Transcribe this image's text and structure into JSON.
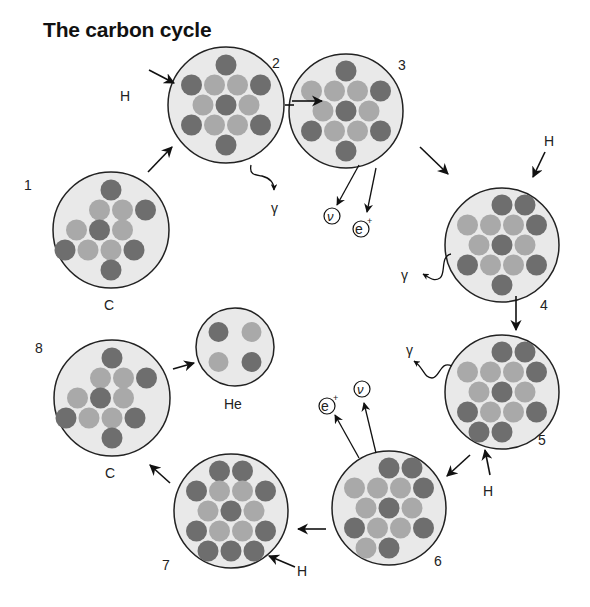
{
  "title": "The carbon cycle",
  "colors": {
    "nucleus_fill": "#e9e9e9",
    "outline": "#222222",
    "dark": "#6e6e6e",
    "light": "#a9a9a9"
  },
  "nuclei": [
    {
      "step": "1",
      "label": "C",
      "cx": 111,
      "cy": 230,
      "r": 58,
      "rows": [
        [
          "D"
        ],
        [
          "L",
          "L",
          "D"
        ],
        [
          "L",
          "D",
          "L"
        ],
        [
          "D",
          "L",
          "L",
          "D"
        ],
        [
          "D"
        ]
      ],
      "offsets": [
        0,
        0.5,
        -0.5,
        -0.5,
        0
      ]
    },
    {
      "step": "2",
      "label": "",
      "cx": 226,
      "cy": 105,
      "r": 58,
      "rows": [
        [
          "D"
        ],
        [
          "D",
          "L",
          "L",
          "D"
        ],
        [
          "L",
          "D",
          "L"
        ],
        [
          "D",
          "L",
          "L",
          "D"
        ],
        [
          "D"
        ]
      ],
      "offsets": [
        0,
        0,
        0,
        0,
        0
      ]
    },
    {
      "step": "3",
      "label": "",
      "cx": 346,
      "cy": 111,
      "r": 57,
      "rows": [
        [
          "D"
        ],
        [
          "L",
          "L",
          "L",
          "D"
        ],
        [
          "L",
          "D",
          "L"
        ],
        [
          "D",
          "L",
          "L",
          "D"
        ],
        [
          "D"
        ]
      ],
      "offsets": [
        0,
        0,
        0,
        0,
        0
      ]
    },
    {
      "step": "4",
      "label": "",
      "cx": 502,
      "cy": 245,
      "r": 57,
      "rows": [
        [
          "D",
          "D"
        ],
        [
          "L",
          "L",
          "L",
          "D"
        ],
        [
          "L",
          "D",
          "L"
        ],
        [
          "D",
          "L",
          "L",
          "D"
        ],
        [
          "D"
        ]
      ],
      "offsets": [
        0.5,
        0,
        0,
        0,
        0
      ]
    },
    {
      "step": "5",
      "label": "",
      "cx": 502,
      "cy": 392,
      "r": 57,
      "rows": [
        [
          "D",
          "D"
        ],
        [
          "L",
          "L",
          "L",
          "D"
        ],
        [
          "L",
          "D",
          "L"
        ],
        [
          "D",
          "L",
          "L",
          "D"
        ],
        [
          "D",
          "D"
        ]
      ],
      "offsets": [
        0.5,
        0,
        0,
        0,
        -0.5
      ]
    },
    {
      "step": "6",
      "label": "",
      "cx": 389,
      "cy": 508,
      "r": 57,
      "rows": [
        [
          "D",
          "D"
        ],
        [
          "L",
          "L",
          "L",
          "D"
        ],
        [
          "L",
          "D",
          "L"
        ],
        [
          "D",
          "L",
          "L",
          "D"
        ],
        [
          "L",
          "D"
        ]
      ],
      "offsets": [
        0.5,
        0,
        0,
        0,
        -0.5
      ]
    },
    {
      "step": "7",
      "label": "",
      "cx": 231,
      "cy": 511,
      "r": 57,
      "rows": [
        [
          "D",
          "D"
        ],
        [
          "D",
          "L",
          "L",
          "D"
        ],
        [
          "L",
          "D",
          "L"
        ],
        [
          "D",
          "L",
          "L",
          "D"
        ],
        [
          "D",
          "D",
          "D"
        ]
      ],
      "offsets": [
        0,
        0,
        0,
        0,
        0
      ]
    },
    {
      "step": "8",
      "label": "C",
      "cx": 112,
      "cy": 398,
      "r": 58,
      "rows": [
        [
          "D"
        ],
        [
          "L",
          "L",
          "D"
        ],
        [
          "L",
          "D",
          "L"
        ],
        [
          "D",
          "L",
          "L",
          "D"
        ],
        [
          "D"
        ]
      ],
      "offsets": [
        0,
        0.5,
        -0.5,
        -0.5,
        0
      ]
    }
  ],
  "helium": {
    "label": "He",
    "cx": 235,
    "cy": 347,
    "r": 39,
    "particles": [
      [
        "D",
        "L"
      ],
      [
        "L",
        "D"
      ]
    ]
  },
  "particles": {
    "hydrogen": "H",
    "gamma": "γ",
    "neutrino": "ν",
    "positron": "e",
    "positron_sup": "+"
  }
}
